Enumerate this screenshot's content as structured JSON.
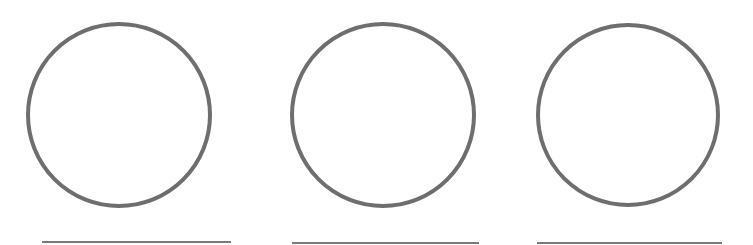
{
  "diagram": {
    "type": "worksheet-figure",
    "width": 753,
    "height": 245,
    "background": "#ffffff",
    "stroke_color": "#6e6e6e",
    "line_color": "#7a7a7a",
    "circle_stroke_width": 4,
    "line_stroke_width": 2,
    "items": [
      {
        "circle": {
          "cx": 119,
          "cy": 115,
          "r": 91
        },
        "answer_line": {
          "x1": 42,
          "x2": 231,
          "y": 242
        }
      },
      {
        "circle": {
          "cx": 383,
          "cy": 115,
          "r": 91
        },
        "answer_line": {
          "x1": 292,
          "x2": 479,
          "y": 243
        }
      },
      {
        "circle": {
          "cx": 628,
          "cy": 115,
          "r": 90
        },
        "answer_line": {
          "x1": 537,
          "x2": 722,
          "y": 243
        }
      }
    ]
  }
}
